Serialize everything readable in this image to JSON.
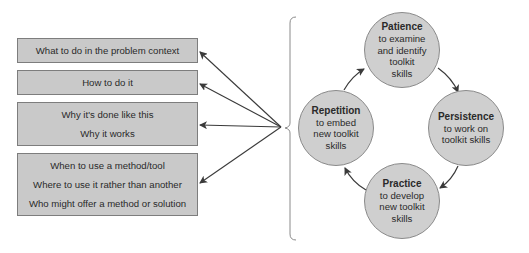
{
  "left_boxes": [
    {
      "lines": [
        "What to do in the problem context"
      ]
    },
    {
      "lines": [
        "How to do it"
      ]
    },
    {
      "lines": [
        "Why it's done like this",
        "Why it works"
      ]
    },
    {
      "lines": [
        "When to use a method/tool",
        "Where to use it rather than another",
        "Who might offer a method or solution"
      ]
    }
  ],
  "cycle": [
    {
      "title": "Patience",
      "lines": [
        "to examine",
        "and identify",
        "toolkit",
        "skills"
      ]
    },
    {
      "title": "Persistence",
      "lines": [
        "to work on",
        "toolkit skills"
      ]
    },
    {
      "title": "Practice",
      "lines": [
        "to develop",
        "new toolkit",
        "skills"
      ]
    },
    {
      "title": "Repetition",
      "lines": [
        "to embed",
        "new toolkit",
        "skills"
      ]
    }
  ],
  "colors": {
    "box_fill": "#c9c9c9",
    "circle_fill": "#cfcfcf",
    "arrow": "#3a3a3a",
    "bracket": "#8a8a8a"
  }
}
